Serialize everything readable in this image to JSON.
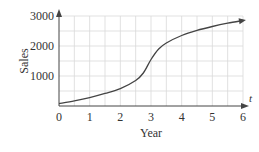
{
  "chart_data": {
    "type": "line",
    "title": "",
    "xlabel": "Year",
    "ylabel": "Sales",
    "x_axis_variable": "t",
    "xlim": [
      0,
      6
    ],
    "ylim": [
      0,
      3000
    ],
    "x_ticks": [
      "0",
      "1",
      "2",
      "3",
      "4",
      "5",
      "6"
    ],
    "y_ticks": [
      "1000",
      "2000",
      "3000"
    ],
    "grid": true,
    "grid_x_step": 0.5,
    "grid_y_step": 500,
    "legend": null,
    "series": [
      {
        "name": "Sales",
        "x": [
          0,
          0.5,
          1,
          1.5,
          2,
          2.5,
          2.75,
          3,
          3.25,
          3.5,
          4,
          4.5,
          5,
          5.5,
          6
        ],
        "values": [
          80,
          170,
          280,
          420,
          580,
          850,
          1100,
          1550,
          1900,
          2100,
          2350,
          2520,
          2650,
          2760,
          2850
        ]
      }
    ],
    "colors": {
      "curve": "#444444",
      "axis": "#444444",
      "grid": "#d9d9d9"
    }
  }
}
